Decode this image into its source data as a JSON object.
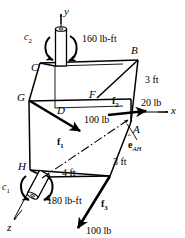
{
  "figure": {
    "type": "engineering-free-body-diagram",
    "axes": {
      "y_label": "y",
      "x_label": "x",
      "z_label": "z"
    },
    "vertices": {
      "A": "A",
      "B": "B",
      "C": "C",
      "D": "D",
      "F": "F",
      "G": "G",
      "H": "H"
    },
    "forces": [
      {
        "name": "f1",
        "symbol": "f",
        "index": "1",
        "magnitude": "100 lb"
      },
      {
        "name": "f2",
        "symbol": "f",
        "index": "2",
        "magnitude": "20 lb"
      },
      {
        "name": "f3",
        "symbol": "f",
        "index": "3",
        "magnitude": "100 lb"
      }
    ],
    "couples": [
      {
        "name": "c1",
        "symbol": "c",
        "index": "1",
        "magnitude": "180 lb-ft"
      },
      {
        "name": "c2",
        "symbol": "c",
        "index": "2",
        "magnitude": "160 lb-ft"
      }
    ],
    "dimensions": [
      {
        "name": "height-right",
        "value": "3 ft"
      },
      {
        "name": "depth-right",
        "value": "3 ft"
      },
      {
        "name": "width-bottom",
        "value": "4 ft"
      }
    ],
    "unit_vector": {
      "symbol": "e",
      "subscript": "AH",
      "label": "e_AH"
    },
    "colors": {
      "line": "#000000",
      "background": "#ffffff"
    }
  }
}
